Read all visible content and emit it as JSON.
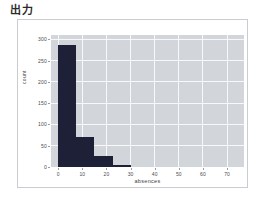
{
  "page": {
    "title": "出力",
    "background_color": "#ffffff"
  },
  "card": {
    "name": "output-card",
    "border_color": "#c9ccd1",
    "background_color": "#ffffff"
  },
  "chart_data": {
    "type": "bar",
    "title": "",
    "xlabel": "absences",
    "ylabel": "count",
    "grid": true,
    "legend": "none",
    "panel_background": "#d2d5da",
    "gridline_color": "#f7f8f9",
    "bar_color": "#1d2036",
    "xlim": [
      -3,
      77
    ],
    "ylim": [
      0,
      310
    ],
    "xticks": [
      0,
      10,
      20,
      30,
      40,
      50,
      60,
      70
    ],
    "xtick_labels": [
      "0",
      "10",
      "20",
      "30",
      "40",
      "50",
      "60",
      "70"
    ],
    "yticks": [
      0,
      50,
      100,
      150,
      200,
      250,
      300
    ],
    "ytick_labels": [
      "0",
      "50",
      "100",
      "150",
      "200",
      "250",
      "300"
    ],
    "bins": [
      {
        "x0": 0,
        "x1": 7.5,
        "value": 287
      },
      {
        "x0": 7.5,
        "x1": 15,
        "value": 70
      },
      {
        "x0": 15,
        "x1": 22.5,
        "value": 25
      },
      {
        "x0": 22.5,
        "x1": 30,
        "value": 4
      }
    ],
    "categories": [
      "0-7.5",
      "7.5-15",
      "15-22.5",
      "22.5-30"
    ],
    "values": [
      287,
      70,
      25,
      4
    ]
  }
}
